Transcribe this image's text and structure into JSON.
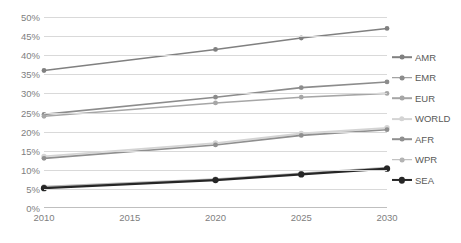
{
  "chart_data": {
    "type": "line",
    "title": "",
    "xlabel": "",
    "ylabel": "",
    "x": [
      2010,
      2015,
      2020,
      2025,
      2030
    ],
    "xtick_labels": [
      "2010",
      "2015",
      "2020",
      "2025",
      "2030"
    ],
    "ytick_labels": [
      "0%",
      "5%",
      "10%",
      "15%",
      "20%",
      "25%",
      "30%",
      "35%",
      "40%",
      "45%",
      "50%"
    ],
    "ytick_values": [
      0,
      5,
      10,
      15,
      20,
      25,
      30,
      35,
      40,
      45,
      50
    ],
    "ylim": [
      0,
      50
    ],
    "xlim": [
      2010,
      2030
    ],
    "grid": true,
    "grid_axis": "y",
    "legend_position": "right",
    "marker_x": [
      2010,
      2020,
      2025,
      2030
    ],
    "series": [
      {
        "name": "AMR",
        "color": "#808080",
        "width": 1.6,
        "points": [
          {
            "x": 2010,
            "y": 36.0
          },
          {
            "x": 2020,
            "y": 41.5
          },
          {
            "x": 2025,
            "y": 44.5
          },
          {
            "x": 2030,
            "y": 47.0
          }
        ]
      },
      {
        "name": "EMR",
        "color": "#8c8c8c",
        "width": 1.6,
        "points": [
          {
            "x": 2010,
            "y": 24.5
          },
          {
            "x": 2020,
            "y": 29.0
          },
          {
            "x": 2025,
            "y": 31.5
          },
          {
            "x": 2030,
            "y": 33.0
          }
        ]
      },
      {
        "name": "EUR",
        "color": "#a6a6a6",
        "width": 1.6,
        "points": [
          {
            "x": 2010,
            "y": 24.0
          },
          {
            "x": 2020,
            "y": 27.5
          },
          {
            "x": 2025,
            "y": 29.0
          },
          {
            "x": 2030,
            "y": 30.0
          }
        ]
      },
      {
        "name": "WORLD",
        "color": "#d4d4d4",
        "width": 1.8,
        "points": [
          {
            "x": 2010,
            "y": 13.5
          },
          {
            "x": 2020,
            "y": 17.0
          },
          {
            "x": 2025,
            "y": 19.5
          },
          {
            "x": 2030,
            "y": 21.0
          }
        ]
      },
      {
        "name": "AFR",
        "color": "#8f8f8f",
        "width": 1.6,
        "points": [
          {
            "x": 2010,
            "y": 13.0
          },
          {
            "x": 2020,
            "y": 16.5
          },
          {
            "x": 2025,
            "y": 19.0
          },
          {
            "x": 2030,
            "y": 20.5
          }
        ]
      },
      {
        "name": "WPR",
        "color": "#b3b3b3",
        "width": 1.6,
        "points": [
          {
            "x": 2010,
            "y": 5.6
          },
          {
            "x": 2020,
            "y": 7.6
          },
          {
            "x": 2025,
            "y": 9.1
          },
          {
            "x": 2030,
            "y": 10.6
          }
        ]
      },
      {
        "name": "SEA",
        "color": "#262626",
        "width": 2.1,
        "points": [
          {
            "x": 2010,
            "y": 5.2
          },
          {
            "x": 2020,
            "y": 7.3
          },
          {
            "x": 2025,
            "y": 8.8
          },
          {
            "x": 2030,
            "y": 10.3
          }
        ]
      }
    ]
  }
}
